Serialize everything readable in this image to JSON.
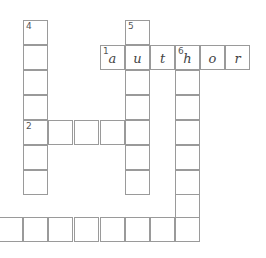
{
  "puzzle": {
    "type": "crossword",
    "cell_size": 25,
    "cells": [
      {
        "x": 23,
        "y": 20,
        "num": "4",
        "letter": ""
      },
      {
        "x": 23,
        "y": 45,
        "num": "",
        "letter": ""
      },
      {
        "x": 23,
        "y": 70,
        "num": "",
        "letter": ""
      },
      {
        "x": 23,
        "y": 95,
        "num": "",
        "letter": ""
      },
      {
        "x": 23,
        "y": 120,
        "num": "2",
        "letter": ""
      },
      {
        "x": 23,
        "y": 145,
        "num": "",
        "letter": ""
      },
      {
        "x": 23,
        "y": 170,
        "num": "",
        "letter": ""
      },
      {
        "x": 48,
        "y": 120,
        "num": "",
        "letter": ""
      },
      {
        "x": 74,
        "y": 120,
        "num": "",
        "letter": ""
      },
      {
        "x": 100,
        "y": 120,
        "num": "",
        "letter": ""
      },
      {
        "x": 125,
        "y": 20,
        "num": "5",
        "letter": ""
      },
      {
        "x": 125,
        "y": 45,
        "num": "",
        "letter": "u"
      },
      {
        "x": 125,
        "y": 70,
        "num": "",
        "letter": ""
      },
      {
        "x": 125,
        "y": 95,
        "num": "",
        "letter": ""
      },
      {
        "x": 125,
        "y": 120,
        "num": "",
        "letter": ""
      },
      {
        "x": 125,
        "y": 145,
        "num": "",
        "letter": ""
      },
      {
        "x": 125,
        "y": 170,
        "num": "",
        "letter": ""
      },
      {
        "x": 100,
        "y": 45,
        "num": "1",
        "letter": "a"
      },
      {
        "x": 150,
        "y": 45,
        "num": "",
        "letter": "t"
      },
      {
        "x": 175,
        "y": 45,
        "num": "6",
        "letter": "h"
      },
      {
        "x": 200,
        "y": 45,
        "num": "",
        "letter": "o"
      },
      {
        "x": 225,
        "y": 45,
        "num": "",
        "letter": "r"
      },
      {
        "x": 175,
        "y": 70,
        "num": "",
        "letter": ""
      },
      {
        "x": 175,
        "y": 95,
        "num": "",
        "letter": ""
      },
      {
        "x": 175,
        "y": 120,
        "num": "",
        "letter": ""
      },
      {
        "x": 175,
        "y": 145,
        "num": "",
        "letter": ""
      },
      {
        "x": 175,
        "y": 170,
        "num": "",
        "letter": ""
      },
      {
        "x": 175,
        "y": 194,
        "num": "",
        "letter": ""
      },
      {
        "x": 175,
        "y": 217,
        "num": "",
        "letter": ""
      },
      {
        "x": -2,
        "y": 217,
        "num": "",
        "letter": ""
      },
      {
        "x": 23,
        "y": 217,
        "num": "",
        "letter": ""
      },
      {
        "x": 48,
        "y": 217,
        "num": "",
        "letter": ""
      },
      {
        "x": 74,
        "y": 217,
        "num": "",
        "letter": ""
      },
      {
        "x": 100,
        "y": 217,
        "num": "",
        "letter": ""
      },
      {
        "x": 125,
        "y": 217,
        "num": "",
        "letter": ""
      },
      {
        "x": 150,
        "y": 217,
        "num": "",
        "letter": ""
      }
    ],
    "filled_word": {
      "number": "1",
      "direction": "across",
      "answer": "author"
    }
  }
}
